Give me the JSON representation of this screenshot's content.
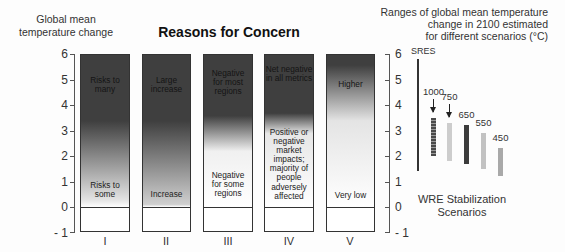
{
  "chart_data": {
    "type": "bar",
    "title": "Reasons for Concern",
    "ylabel": "Global mean\ntemperature change",
    "ylim": [
      -1,
      6
    ],
    "yticks": [
      "6",
      "5",
      "4",
      "3",
      "2",
      "1",
      "0",
      "- 1"
    ],
    "grid": false,
    "categories": [
      "I",
      "II",
      "III",
      "IV",
      "V"
    ],
    "reasons": [
      {
        "id": "I",
        "top_text": "Risks to\nmany",
        "bottom_text": "Risks to\nsome",
        "dark_until": 3.4,
        "light_at": 0.3,
        "light_color": "#e2e2e2"
      },
      {
        "id": "II",
        "top_text": "Large\nincrease",
        "bottom_text": "Increase",
        "dark_until": 3.4,
        "light_at": 0.1,
        "light_color": "#cfcfcf"
      },
      {
        "id": "III",
        "top_text": "Negative\nfor most\nregions",
        "bottom_text": "Negative\nfor some\nregions",
        "dark_until": 3.6,
        "light_at": 2.2,
        "light_color": "#f0f0f0"
      },
      {
        "id": "IV",
        "top_text": "Net negative\nin all metrics",
        "bottom_text": "Positive or\nnegative\nmarket\nimpacts;\nmajority of\npeople\nadversely\naffected",
        "dark_until": 3.7,
        "light_at": 2.9,
        "light_color": "#e6e6e6"
      },
      {
        "id": "V",
        "top_text": "Higher",
        "bottom_text": "Very low",
        "dark_until": 5.6,
        "light_at": 3.4,
        "light_color": "#e4e4e4"
      }
    ],
    "colors": {
      "dark": "#3f3f3f",
      "light": "#ffffff",
      "border": "#333333"
    },
    "scenarios_panel": {
      "title": "Ranges of global mean temperature\nchange in 2100 estimated\nfor different scenarios (°C)",
      "sres": {
        "label": "SRES",
        "range": [
          1.4,
          5.8
        ]
      },
      "wre": {
        "label": "WRE Stabilization\nScenarios",
        "series": [
          {
            "name": "1000",
            "range": [
              2.0,
              3.5
            ],
            "color": "#4a4a4a",
            "striped": true,
            "arrow": true
          },
          {
            "name": "750",
            "range": [
              1.8,
              3.3
            ],
            "color": "#cdcdcd",
            "striped": false,
            "arrow": true
          },
          {
            "name": "650",
            "range": [
              1.7,
              3.2
            ],
            "color": "#3c3c3c",
            "striped": false,
            "arrow": false
          },
          {
            "name": "550",
            "range": [
              1.5,
              2.9
            ],
            "color": "#c2c2c2",
            "striped": false,
            "arrow": false
          },
          {
            "name": "450",
            "range": [
              1.2,
              2.3
            ],
            "color": "#a9a9a9",
            "striped": false,
            "arrow": false
          }
        ]
      }
    }
  }
}
